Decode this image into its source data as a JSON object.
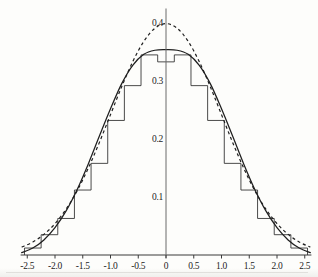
{
  "chart_data": {
    "type": "area",
    "title": "",
    "subtitle": "",
    "xlabel": "",
    "ylabel": "",
    "xlim": [
      -2.6,
      2.6
    ],
    "ylim": [
      0,
      0.42
    ],
    "grid": false,
    "legend_position": "none",
    "x_ticks": [
      -2.5,
      -2.0,
      -1.5,
      -1.0,
      -0.5,
      0,
      0.5,
      1.0,
      1.5,
      2.0,
      2.5
    ],
    "x_tick_labels": [
      "-2.5",
      "-2.0",
      "-1.5",
      "-1.0",
      "-0.5",
      "0",
      "0.5",
      "1.0",
      "1.5",
      "2.0",
      "2.5"
    ],
    "y_ticks": [
      0.1,
      0.2,
      0.3,
      0.4
    ],
    "y_tick_labels": [
      "0.1",
      "0.2",
      "0.3",
      "0.4"
    ],
    "series": [
      {
        "name": "histogram",
        "style": "step",
        "bin_edges": [
          -2.55,
          -2.25,
          -1.95,
          -1.65,
          -1.35,
          -1.05,
          -0.75,
          -0.45,
          -0.15,
          0.15,
          0.45,
          0.75,
          1.05,
          1.35,
          1.65,
          1.95,
          2.25,
          2.55
        ],
        "values": [
          0.012,
          0.035,
          0.063,
          0.112,
          0.158,
          0.232,
          0.292,
          0.345,
          0.333,
          0.345,
          0.292,
          0.232,
          0.158,
          0.112,
          0.063,
          0.035,
          0.012
        ]
      },
      {
        "name": "smooth-density-estimate",
        "style": "solid",
        "peak": 0.353,
        "x": [
          -2.6,
          -2.4,
          -2.2,
          -2.0,
          -1.8,
          -1.6,
          -1.4,
          -1.2,
          -1.0,
          -0.8,
          -0.6,
          -0.4,
          -0.2,
          0,
          0.2,
          0.4,
          0.6,
          0.8,
          1.0,
          1.2,
          1.4,
          1.6,
          1.8,
          2.0,
          2.2,
          2.4,
          2.6
        ],
        "values": [
          0.004,
          0.012,
          0.026,
          0.047,
          0.076,
          0.113,
          0.157,
          0.205,
          0.252,
          0.295,
          0.327,
          0.346,
          0.353,
          0.354,
          0.353,
          0.346,
          0.327,
          0.295,
          0.252,
          0.205,
          0.157,
          0.113,
          0.076,
          0.047,
          0.026,
          0.012,
          0.004
        ]
      },
      {
        "name": "normal-reference-curve",
        "style": "dashed",
        "peak": 0.3989,
        "x": [
          -2.6,
          -2.4,
          -2.2,
          -2.0,
          -1.8,
          -1.6,
          -1.4,
          -1.2,
          -1.0,
          -0.8,
          -0.6,
          -0.4,
          -0.2,
          0,
          0.2,
          0.4,
          0.6,
          0.8,
          1.0,
          1.2,
          1.4,
          1.6,
          1.8,
          2.0,
          2.2,
          2.4,
          2.6
        ],
        "values": [
          0.0136,
          0.0224,
          0.0355,
          0.054,
          0.079,
          0.1109,
          0.1497,
          0.1942,
          0.242,
          0.2897,
          0.3332,
          0.3683,
          0.391,
          0.3989,
          0.391,
          0.3683,
          0.3332,
          0.2897,
          0.242,
          0.1942,
          0.1497,
          0.1109,
          0.079,
          0.054,
          0.0355,
          0.0224,
          0.0136
        ]
      }
    ]
  },
  "axes": {
    "origin_label": "0"
  }
}
